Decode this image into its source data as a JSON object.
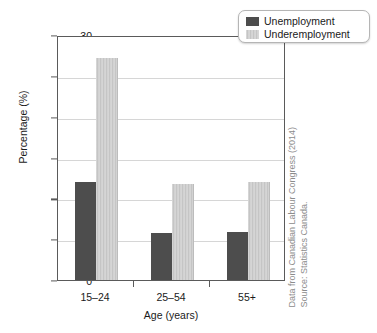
{
  "chart_data": {
    "type": "bar",
    "title": "",
    "subtitle": "",
    "xlabel": "Age (years)",
    "ylabel": "Percentage (%)",
    "categories": [
      "15–24",
      "25–54",
      "55+"
    ],
    "series": [
      {
        "name": "Unemployment",
        "values": [
          12.0,
          5.7,
          5.9
        ],
        "color": "#4d4d4d"
      },
      {
        "name": "Underemployment",
        "values": [
          27.2,
          11.8,
          12.0
        ],
        "color": "#c5c5c5"
      }
    ],
    "ylim": [
      0,
      30
    ],
    "yticks": [
      0,
      5,
      10,
      15,
      20,
      25,
      30
    ],
    "ytick_labels": [
      "0",
      "5",
      "10",
      "15",
      "20",
      "25",
      "30"
    ],
    "grid": true,
    "grid_axis": "y",
    "legend_position": "top-right",
    "annotations": [
      "Data from Canadian Labour Congress (2014)",
      "Source: Statistics Canada."
    ]
  },
  "legend": {
    "entries": [
      {
        "label": "Unemployment",
        "color": "#4d4d4d"
      },
      {
        "label": "Underemployment",
        "color": "#c5c5c5"
      }
    ]
  },
  "source_note": {
    "line1": "Data from Canadian Labour Congress (2014)",
    "line2": "Source: Statistics Canada."
  },
  "colors": {
    "series_dark": "#4d4d4d",
    "series_light": "#c5c5c5",
    "axis": "#5a5a5a",
    "gridline": "#d6d6d6",
    "text": "#1a1a1a",
    "note_text": "#8c8c8c",
    "background": "#ffffff"
  }
}
